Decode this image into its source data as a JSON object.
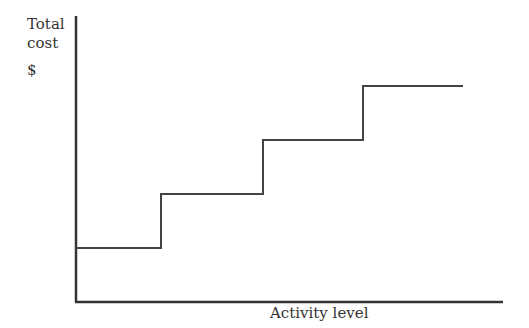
{
  "chart_data": {
    "type": "line",
    "subtype": "step",
    "title": "",
    "xlabel": "Activity level",
    "ylabel": "Total cost",
    "ylabel_unit": "$",
    "grid": false,
    "legend": null,
    "series": [
      {
        "name": "Step fixed cost",
        "steps": [
          {
            "x_start": 0,
            "x_end": 1,
            "level": 1
          },
          {
            "x_start": 1,
            "x_end": 2,
            "level": 2
          },
          {
            "x_start": 2,
            "x_end": 3,
            "level": 3
          },
          {
            "x_start": 3,
            "x_end": 4,
            "level": 4
          }
        ]
      }
    ],
    "pixel_geometry": {
      "origin": [
        76,
        302
      ],
      "x_axis_end": 503,
      "y_axis_top": 16,
      "points": [
        [
          76,
          248
        ],
        [
          161,
          248
        ],
        [
          161,
          194
        ],
        [
          263,
          194
        ],
        [
          263,
          140
        ],
        [
          363,
          140
        ],
        [
          363,
          86
        ],
        [
          463,
          86
        ]
      ]
    }
  },
  "labels": {
    "y_title": "Total cost",
    "y_unit": "$",
    "x_title": "Activity level"
  }
}
